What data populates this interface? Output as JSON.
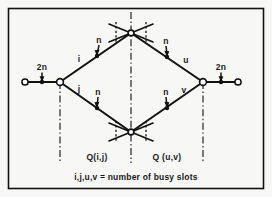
{
  "figure": {
    "caption": "i,j,u,v = number of busy slots",
    "colors": {
      "line": "#111111",
      "background": "#f7f7f5",
      "node_fill": "#ffffff"
    },
    "regions": [
      {
        "id": "left",
        "label": "Q(i,j)"
      },
      {
        "id": "right",
        "label": "Q (u,v)"
      }
    ],
    "edge_labels": {
      "upper_left_branch": "i",
      "lower_left_branch": "j",
      "upper_right_branch": "u",
      "lower_right_branch": "v",
      "upper_left_capacity": "n",
      "upper_right_capacity": "n",
      "lower_left_capacity": "n",
      "lower_right_capacity": "n",
      "left_trunk_capacity": "2n",
      "right_trunk_capacity": "2n"
    },
    "nodes": [
      {
        "id": "left-terminal",
        "type": "terminal"
      },
      {
        "id": "left-junction",
        "type": "junction"
      },
      {
        "id": "top-crossnode",
        "type": "cross"
      },
      {
        "id": "bottom-crossnode",
        "type": "cross"
      },
      {
        "id": "right-junction",
        "type": "junction"
      },
      {
        "id": "right-terminal",
        "type": "terminal"
      }
    ],
    "legend_separator": "="
  }
}
